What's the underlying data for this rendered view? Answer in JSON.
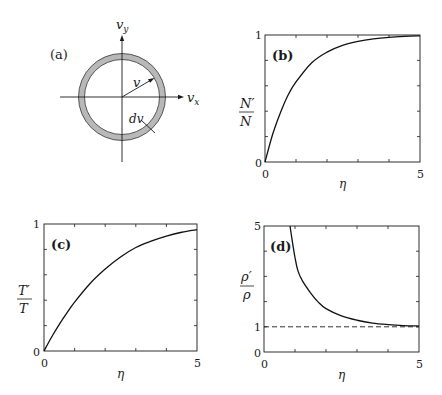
{
  "figure": {
    "panels": [
      {
        "id": "a",
        "label": "(a)"
      },
      {
        "id": "b",
        "label": "(b)"
      },
      {
        "id": "c",
        "label": "(c)"
      },
      {
        "id": "d",
        "label": "(d)"
      }
    ]
  },
  "diagram_a": {
    "label": "(a)",
    "axis_x_label": "v",
    "axis_x_sub": "x",
    "axis_y_label": "v",
    "axis_y_sub": "y",
    "radius_label": "v",
    "shell_label": "dv",
    "shell_color": "#b8b8b8",
    "line_color": "#1a1a1a"
  },
  "chart_data": [
    {
      "panel": "(b)",
      "type": "line",
      "title": "",
      "xlabel": "η",
      "ylabel_num": "N′",
      "ylabel_den": "N",
      "xlim": [
        0,
        5
      ],
      "ylim": [
        0,
        1
      ],
      "x_tick_labels": [
        "0",
        "5"
      ],
      "y_tick_labels": [
        "0",
        "1"
      ],
      "minor_ticks_x": [
        1,
        2,
        3,
        4
      ],
      "minor_ticks_y": [
        0.2,
        0.4,
        0.6,
        0.8
      ],
      "grid": false,
      "series": [
        {
          "name": "N'/N",
          "style": "solid",
          "x": [
            0,
            0.25,
            0.5,
            0.75,
            1,
            1.5,
            2,
            2.5,
            3,
            3.5,
            4,
            4.5,
            5
          ],
          "y": [
            0,
            0.22,
            0.39,
            0.53,
            0.63,
            0.78,
            0.865,
            0.918,
            0.95,
            0.97,
            0.982,
            0.989,
            0.993
          ]
        }
      ]
    },
    {
      "panel": "(c)",
      "type": "line",
      "title": "",
      "xlabel": "η",
      "ylabel_num": "T′",
      "ylabel_den": "T",
      "xlim": [
        0,
        5
      ],
      "ylim": [
        0,
        1
      ],
      "x_tick_labels": [
        "0",
        "5"
      ],
      "y_tick_labels": [
        "0",
        "1"
      ],
      "minor_ticks_x": [
        1,
        2,
        3,
        4
      ],
      "minor_ticks_y": [
        0.2,
        0.4,
        0.6,
        0.8
      ],
      "grid": false,
      "series": [
        {
          "name": "T'/T",
          "style": "solid",
          "x": [
            0,
            0.25,
            0.5,
            0.75,
            1,
            1.5,
            2,
            2.5,
            3,
            3.5,
            4,
            4.5,
            5
          ],
          "y": [
            0,
            0.11,
            0.21,
            0.3,
            0.385,
            0.53,
            0.645,
            0.74,
            0.815,
            0.865,
            0.905,
            0.935,
            0.955
          ]
        }
      ]
    },
    {
      "panel": "(d)",
      "type": "line",
      "title": "",
      "xlabel": "η",
      "ylabel_num": "ρ′",
      "ylabel_den": "ρ",
      "xlim": [
        0,
        5
      ],
      "ylim": [
        0,
        5
      ],
      "x_tick_labels": [
        "0",
        "5"
      ],
      "y_tick_labels": [
        "0",
        "1",
        "5"
      ],
      "y_tick_label_values": [
        0,
        1,
        5
      ],
      "minor_ticks_x": [
        1,
        2,
        3,
        4
      ],
      "minor_ticks_y": [
        1,
        2,
        3,
        4
      ],
      "grid": false,
      "reference_line": {
        "y": 1,
        "style": "dashed"
      },
      "series": [
        {
          "name": "rho'/rho",
          "style": "solid",
          "x": [
            0.84,
            0.9,
            1,
            1.1,
            1.25,
            1.5,
            1.75,
            2,
            2.5,
            3,
            3.5,
            4,
            4.5,
            5
          ],
          "y": [
            5.0,
            4.5,
            3.75,
            3.2,
            2.8,
            2.35,
            1.98,
            1.72,
            1.43,
            1.26,
            1.15,
            1.09,
            1.05,
            1.03
          ]
        }
      ]
    }
  ]
}
